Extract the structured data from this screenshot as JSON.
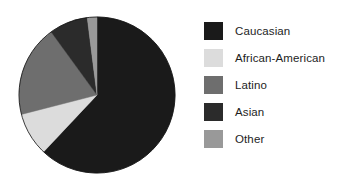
{
  "chart_data": {
    "type": "pie",
    "title": "",
    "subtitle": "",
    "xlabel": "",
    "ylabel": "",
    "grid": false,
    "legend_position": "right",
    "start_angle_deg": 0,
    "direction": "clockwise",
    "categories": [
      "Caucasian",
      "African-American",
      "Latino",
      "Asian",
      "Other"
    ],
    "values": [
      62,
      9,
      19,
      8,
      2
    ],
    "units": "percent",
    "colors": [
      "#1a1a1a",
      "#dcdcdc",
      "#6e6e6e",
      "#2b2b2b",
      "#999999"
    ],
    "slices": [
      {
        "label": "Caucasian",
        "value": 62,
        "color": "#1a1a1a"
      },
      {
        "label": "African-American",
        "value": 9,
        "color": "#dcdcdc"
      },
      {
        "label": "Latino",
        "value": 19,
        "color": "#6e6e6e"
      },
      {
        "label": "Asian",
        "value": 8,
        "color": "#2b2b2b"
      },
      {
        "label": "Other",
        "value": 2,
        "color": "#999999"
      }
    ]
  },
  "legend": {
    "items": [
      {
        "label": "Caucasian",
        "color": "#1a1a1a",
        "swatch_name": "legend-swatch-caucasian"
      },
      {
        "label": "African-American",
        "color": "#dcdcdc",
        "swatch_name": "legend-swatch-african-american"
      },
      {
        "label": "Latino",
        "color": "#6e6e6e",
        "swatch_name": "legend-swatch-latino"
      },
      {
        "label": "Asian",
        "color": "#2b2b2b",
        "swatch_name": "legend-swatch-asian"
      },
      {
        "label": "Other",
        "color": "#999999",
        "swatch_name": "legend-swatch-other"
      }
    ]
  },
  "pie": {
    "center_x": 97,
    "center_y": 95,
    "radius": 78,
    "outline_color": "#111111"
  },
  "colors": {
    "background": "#ffffff",
    "text": "#1d1d1d"
  }
}
